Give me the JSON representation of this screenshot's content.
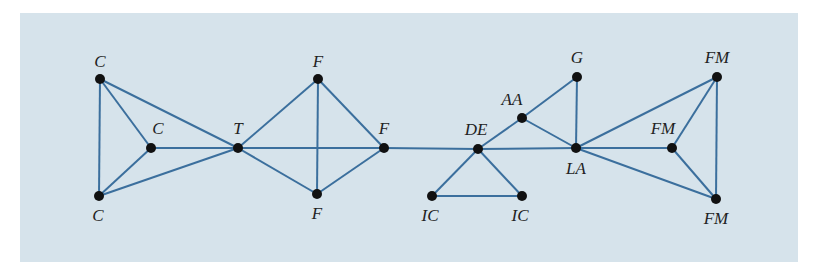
{
  "diagram": {
    "type": "network-graph",
    "colors": {
      "background": "#d6e3eb",
      "edge": "#3b6f9d",
      "node": "#111111"
    },
    "nodes": [
      {
        "id": "c1",
        "label": "C",
        "x": 100,
        "y": 79,
        "lx": 100,
        "ly": 67
      },
      {
        "id": "c2",
        "label": "C",
        "x": 151,
        "y": 148,
        "lx": 158,
        "ly": 134
      },
      {
        "id": "c3",
        "label": "C",
        "x": 99,
        "y": 196,
        "lx": 98,
        "ly": 221
      },
      {
        "id": "t",
        "label": "T",
        "x": 238,
        "y": 148,
        "lx": 238,
        "ly": 134
      },
      {
        "id": "f1",
        "label": "F",
        "x": 318,
        "y": 79,
        "lx": 318,
        "ly": 67
      },
      {
        "id": "f2",
        "label": "F",
        "x": 384,
        "y": 148,
        "lx": 384,
        "ly": 134
      },
      {
        "id": "f3",
        "label": "F",
        "x": 317,
        "y": 194,
        "lx": 317,
        "ly": 219
      },
      {
        "id": "de",
        "label": "DE",
        "x": 478,
        "y": 149,
        "lx": 476,
        "ly": 135
      },
      {
        "id": "ic1",
        "label": "IC",
        "x": 432,
        "y": 196,
        "lx": 430,
        "ly": 221
      },
      {
        "id": "ic2",
        "label": "IC",
        "x": 522,
        "y": 196,
        "lx": 520,
        "ly": 221
      },
      {
        "id": "aa",
        "label": "AA",
        "x": 522,
        "y": 118,
        "lx": 512,
        "ly": 105
      },
      {
        "id": "g",
        "label": "G",
        "x": 577,
        "y": 77,
        "lx": 577,
        "ly": 63
      },
      {
        "id": "la",
        "label": "LA",
        "x": 576,
        "y": 148,
        "lx": 576,
        "ly": 174
      },
      {
        "id": "fm1",
        "label": "FM",
        "x": 717,
        "y": 77,
        "lx": 717,
        "ly": 63
      },
      {
        "id": "fm2",
        "label": "FM",
        "x": 672,
        "y": 148,
        "lx": 663,
        "ly": 134
      },
      {
        "id": "fm3",
        "label": "FM",
        "x": 716,
        "y": 199,
        "lx": 716,
        "ly": 224
      }
    ],
    "edges": [
      [
        "c1",
        "c3"
      ],
      [
        "c1",
        "c2"
      ],
      [
        "c1",
        "t"
      ],
      [
        "c2",
        "c3"
      ],
      [
        "c2",
        "t"
      ],
      [
        "c3",
        "t"
      ],
      [
        "t",
        "f1"
      ],
      [
        "t",
        "f2"
      ],
      [
        "t",
        "f3"
      ],
      [
        "f1",
        "f2"
      ],
      [
        "f1",
        "f3"
      ],
      [
        "f2",
        "f3"
      ],
      [
        "f2",
        "de"
      ],
      [
        "de",
        "ic1"
      ],
      [
        "de",
        "ic2"
      ],
      [
        "ic1",
        "ic2"
      ],
      [
        "de",
        "aa"
      ],
      [
        "aa",
        "g"
      ],
      [
        "aa",
        "la"
      ],
      [
        "de",
        "la"
      ],
      [
        "g",
        "la"
      ],
      [
        "la",
        "fm1"
      ],
      [
        "la",
        "fm2"
      ],
      [
        "la",
        "fm3"
      ],
      [
        "fm1",
        "fm2"
      ],
      [
        "fm1",
        "fm3"
      ],
      [
        "fm2",
        "fm3"
      ]
    ]
  }
}
